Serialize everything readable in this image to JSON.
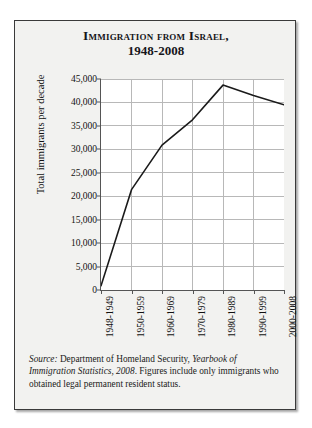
{
  "figure": {
    "title_line1": "Immigration from Israel,",
    "title_line2": "1948-2008",
    "source_label": "Source:",
    "source_agency": " Department of Homeland Security, ",
    "source_publication": "Yearbook of Immigration Statistics, 2008",
    "source_rest": ". Figures include only immigrants who obtained legal permanent resident status."
  },
  "chart_data": {
    "type": "line",
    "title": "Immigration from Israel, 1948-2008",
    "xlabel": "",
    "ylabel": "Total immigrants per decade",
    "categories": [
      "1948-1949",
      "1950-1959",
      "1960-1969",
      "1970-1979",
      "1980-1989",
      "1990-1999",
      "2000-2008"
    ],
    "values": [
      900,
      21400,
      30900,
      36300,
      43700,
      41500,
      39500
    ],
    "ylim": [
      0,
      45000
    ],
    "ytick_values": [
      0,
      5000,
      10000,
      15000,
      20000,
      25000,
      30000,
      35000,
      40000,
      45000
    ],
    "ytick_labels": [
      "0",
      "5,000",
      "10,000",
      "15,000",
      "20,000",
      "25,000",
      "30,000",
      "35,000",
      "40,000",
      "45,000"
    ],
    "grid": true,
    "legend": false,
    "line_color": "#1a1a1a",
    "grid_color": "#b8b8b8",
    "plot_background": "#ffffff"
  }
}
